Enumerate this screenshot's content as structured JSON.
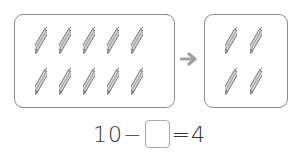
{
  "left_group": {
    "icon": "pencil-icon",
    "count": 10,
    "rows": 2,
    "per_row": 5
  },
  "arrow": {
    "icon": "arrow-right-icon",
    "color": "#a0a0a0"
  },
  "right_group": {
    "icon": "pencil-icon",
    "count": 4,
    "rows": 2,
    "per_row": 2
  },
  "equation": {
    "left": "10",
    "op": "−",
    "blank": "",
    "eq": "=",
    "right": "4"
  },
  "colors": {
    "border": "#8c8c8c",
    "pencil_fill": "#cfcfcf",
    "pencil_stroke": "#6e6e6e"
  }
}
